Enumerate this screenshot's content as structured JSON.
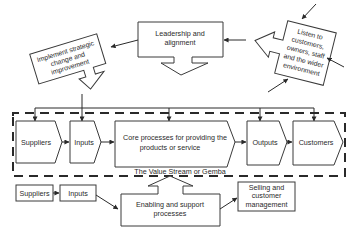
{
  "diagram": {
    "type": "process-flow",
    "leadership": {
      "label_line1": "Leadership and",
      "label_line2": "alignment"
    },
    "implement": {
      "label_line1": "Implement strategic",
      "label_line2": "change and",
      "label_line3": "improvement"
    },
    "listen": {
      "label_line1": "Listen to",
      "label_line2": "customers,",
      "label_line3": "owners, staff",
      "label_line4": "and the wider",
      "label_line5": "environment"
    },
    "value_stream": {
      "caption": "The Value Stream or Gemba",
      "steps": [
        {
          "id": "suppliers",
          "label": "Suppliers"
        },
        {
          "id": "inputs",
          "label": "Inputs"
        },
        {
          "id": "core",
          "label_line1": "Core processes for providing the",
          "label_line2": "products or service"
        },
        {
          "id": "outputs",
          "label": "Outputs"
        },
        {
          "id": "customers",
          "label": "Customers"
        }
      ]
    },
    "support": {
      "suppliers": "Suppliers",
      "inputs": "Inputs",
      "enabling": {
        "label_line1": "Enabling and support",
        "label_line2": "processes"
      },
      "selling": {
        "label_line1": "Selling and",
        "label_line2": "customer",
        "label_line3": "management"
      }
    },
    "colors": {
      "stroke": "#3a3a3a",
      "text": "#2a2a2a",
      "background": "#ffffff"
    }
  }
}
